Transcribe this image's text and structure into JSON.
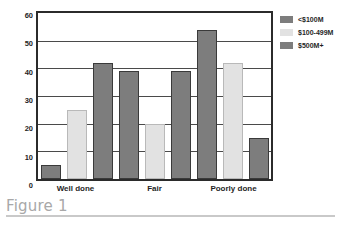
{
  "caption": {
    "text": "Figure 1"
  },
  "chart_data": {
    "type": "bar",
    "title": "",
    "xlabel": "",
    "ylabel": "",
    "ylim": [
      0,
      60
    ],
    "yticks": [
      60,
      50,
      40,
      30,
      20,
      10,
      0
    ],
    "grid": true,
    "legend_position": "right",
    "categories": [
      "Well done",
      "Fair",
      "Poorly done"
    ],
    "series": [
      {
        "name": "<$100M",
        "color": "#7d7d7d",
        "values": [
          5,
          39,
          54
        ]
      },
      {
        "name": "$100-499M",
        "color": "#e2e2e2",
        "values": [
          25,
          20,
          42
        ]
      },
      {
        "name": "$500M+",
        "color": "#7d7d7d",
        "values": [
          42,
          39,
          15
        ]
      }
    ]
  }
}
